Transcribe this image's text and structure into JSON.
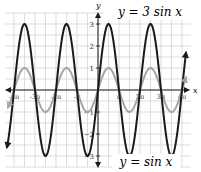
{
  "chart_data": {
    "type": "line",
    "title": "",
    "xlabel": "x",
    "ylabel": "y",
    "xlim": [
      -13.7,
      14.0
    ],
    "ylim": [
      -3.5,
      3.5
    ],
    "grid": true,
    "x_ticks": [
      "-4π",
      "-3π",
      "-2π",
      "-π",
      "π",
      "2π",
      "3π",
      "4π"
    ],
    "x_tick_values": [
      -12.566,
      -9.425,
      -6.283,
      -3.142,
      3.142,
      6.283,
      9.425,
      12.566
    ],
    "y_ticks": [
      "-3",
      "-2",
      "-1",
      "1",
      "2",
      "3"
    ],
    "y_tick_values": [
      -3,
      -2,
      -1,
      1,
      2,
      3
    ],
    "series": [
      {
        "name": "y = 3 sin x",
        "function": "3*sin(x)",
        "amplitude": 3,
        "period": "2π",
        "color": "#1a1a1a",
        "stroke_width": 2,
        "label": "y = 3 sin x",
        "label_position": "top-right"
      },
      {
        "name": "y = sin x",
        "function": "sin(x)",
        "amplitude": 1,
        "period": "2π",
        "color": "#a6a6a6",
        "stroke_width": 2,
        "label": "y = sin x",
        "label_position": "bottom-right"
      }
    ],
    "legend": "inline annotations"
  },
  "labels": {
    "series_top": "y = 3 sin x",
    "series_bottom": "y = sin x",
    "x_axis": "x",
    "y_axis": "y"
  },
  "style": {
    "grid_color": "#cfcfcf",
    "axis_color": "#1a1a1a",
    "dark_curve": "#1a1a1a",
    "light_curve": "#a6a6a6",
    "label_color": "#555555"
  }
}
